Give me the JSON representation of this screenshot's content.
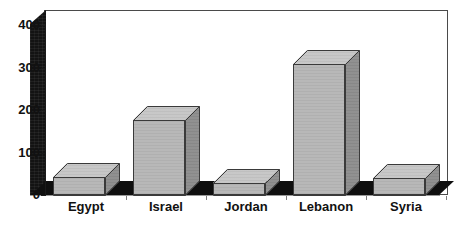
{
  "chart_data": {
    "type": "bar",
    "title": "",
    "subtitle": "",
    "xlabel": "",
    "ylabel": "",
    "categories": [
      "Egypt",
      "Israel",
      "Jordan",
      "Lebanon",
      "Syria"
    ],
    "values": [
      42,
      176,
      28,
      308,
      40
    ],
    "ylim": [
      0,
      400
    ],
    "ytick_labels": [
      "0",
      "100",
      "200",
      "300",
      "400"
    ],
    "ytick_values": [
      0,
      100,
      200,
      300,
      400
    ],
    "grid": false,
    "legend": null,
    "style": {
      "three_d": true,
      "bar_front_color": "#b6b6b6",
      "bar_side_color": "#8d8d8d",
      "bar_top_color": "#c6c6c6",
      "bar_edge_color": "#3a3a3a",
      "wall_color": "#131313",
      "floor_color": "#0f0f0f",
      "plot_background": "#ffffff",
      "plot_border_color": "#4a4a4a",
      "text_color": "#111111"
    }
  }
}
